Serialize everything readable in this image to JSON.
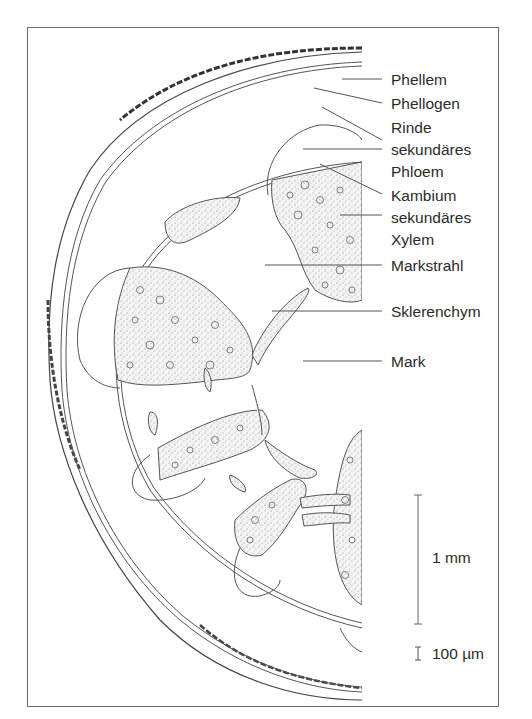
{
  "figure": {
    "colors": {
      "line": "#555555",
      "frame": "#6a6a6a",
      "text": "#2b2b2b",
      "stipple": "#f3f3f3"
    }
  },
  "labels": [
    {
      "id": "phellem",
      "text": "Phellem",
      "y": 71
    },
    {
      "id": "phellogen",
      "text": "Phellogen",
      "y": 95
    },
    {
      "id": "rinde",
      "text": "Rinde",
      "y": 119
    },
    {
      "id": "sek-phloem-1",
      "text": "sekundäres",
      "y": 141
    },
    {
      "id": "sek-phloem-2",
      "text": "Phloem",
      "y": 163
    },
    {
      "id": "kambium",
      "text": "Kambium",
      "y": 187
    },
    {
      "id": "sek-xylem-1",
      "text": "sekundäres",
      "y": 209
    },
    {
      "id": "sek-xylem-2",
      "text": "Xylem",
      "y": 231
    },
    {
      "id": "markstrahl",
      "text": "Markstrahl",
      "y": 257
    },
    {
      "id": "sklerenchym",
      "text": "Sklerenchym",
      "y": 303
    },
    {
      "id": "mark",
      "text": "Mark",
      "y": 353
    }
  ],
  "scale_bars": [
    {
      "id": "scale-1mm",
      "text": "1 mm"
    },
    {
      "id": "scale-100um",
      "text": "100 µm"
    }
  ]
}
